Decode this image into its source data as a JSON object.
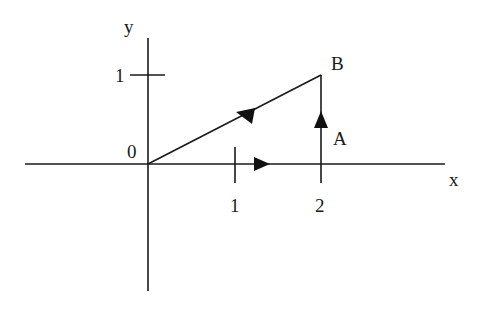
{
  "diagram": {
    "axes": {
      "x_label": "x",
      "y_label": "y",
      "origin_label": "0",
      "x_ticks": [
        "1",
        "2"
      ],
      "y_ticks": [
        "1"
      ]
    },
    "points": {
      "A": {
        "label": "A",
        "coords": [
          2,
          0
        ]
      },
      "B": {
        "label": "B",
        "coords": [
          2,
          1
        ]
      }
    },
    "path": [
      {
        "from": "0",
        "to": "A",
        "description": "along x-axis from (0,0) to (2,0), arrow pointing right"
      },
      {
        "from": "A",
        "to": "B",
        "description": "vertical segment from (2,0) to (2,1), arrow pointing up"
      },
      {
        "from": "0",
        "to": "B",
        "description": "straight line from (0,0) to (2,1), arrow pointing toward B"
      }
    ],
    "colors": {
      "ink": "#1a1a1a",
      "background": "#ffffff"
    }
  }
}
